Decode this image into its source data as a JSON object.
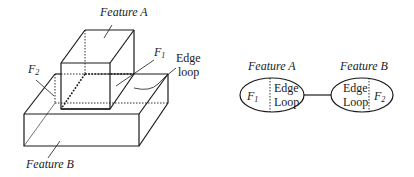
{
  "left_figure": {
    "label_feature_a": "Feature A",
    "label_feature_b": "Feature B",
    "label_f1": "F",
    "label_f1_sub": "1",
    "label_f2": "F",
    "label_f2_sub": "2",
    "label_edge": "Edge",
    "label_loop": "loop"
  },
  "right_figure": {
    "node_a": {
      "title": "Feature A",
      "face": "F",
      "face_sub": "1",
      "loop_line1": "Edge",
      "loop_line2": "Loop"
    },
    "node_b": {
      "title": "Feature B",
      "face": "F",
      "face_sub": "2",
      "loop_line1": "Edge",
      "loop_line2": "Loop"
    }
  },
  "colors": {
    "ink": "#1a1a1a",
    "background": "#ffffff"
  }
}
